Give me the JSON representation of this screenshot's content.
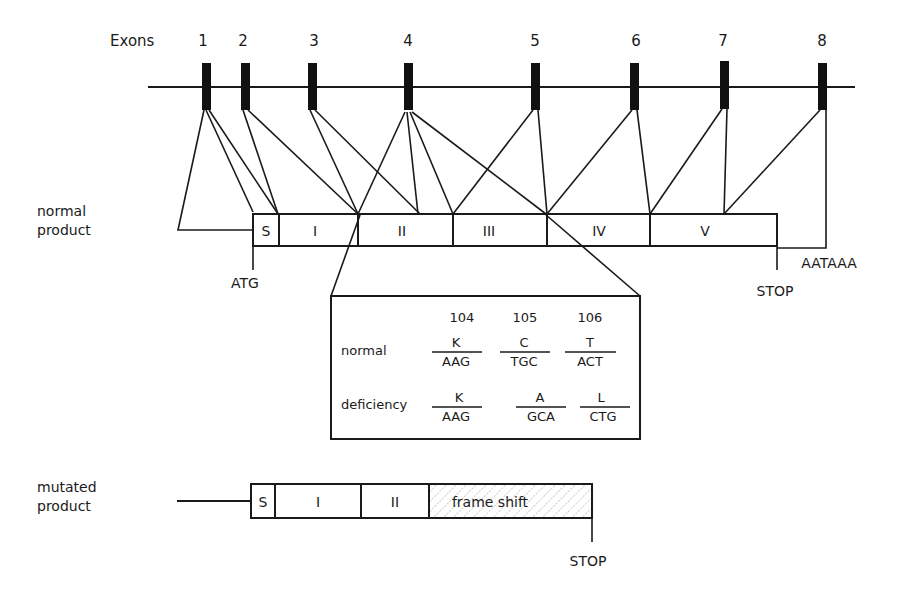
{
  "exons": {
    "label": "Exons",
    "numbers": [
      "1",
      "2",
      "3",
      "4",
      "5",
      "6",
      "7",
      "8"
    ]
  },
  "normal_product": {
    "label_line1": "normal",
    "label_line2": "product",
    "segments": [
      "S",
      "I",
      "II",
      "III",
      "IV",
      "V"
    ],
    "start_label": "ATG",
    "stop_label": "STOP",
    "polya_label": "AATAAA"
  },
  "detail_box": {
    "positions": [
      "104",
      "105",
      "106"
    ],
    "rows": [
      {
        "label": "normal",
        "codons": [
          {
            "aa": "K",
            "codon": "AAG"
          },
          {
            "aa": "C",
            "codon": "TGC"
          },
          {
            "aa": "T",
            "codon": "ACT"
          }
        ]
      },
      {
        "label": "deficiency",
        "codons": [
          {
            "aa": "K",
            "codon": "AAG"
          },
          {
            "aa": "A",
            "codon": "GCA"
          },
          {
            "aa": "L",
            "codon": "CTG"
          }
        ]
      }
    ]
  },
  "mutated_product": {
    "label_line1": "mutated",
    "label_line2": "product",
    "segments": [
      "S",
      "I",
      "II"
    ],
    "frameshift_label": "frame shift",
    "stop_label": "STOP"
  },
  "colors": {
    "ink": "#1a1a1a",
    "hatch": "#9a9a9a",
    "background": "#ffffff"
  }
}
